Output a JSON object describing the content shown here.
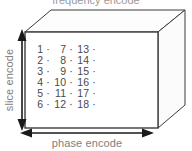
{
  "diagram": {
    "title_cutoff": "frequency encode",
    "axes": {
      "vertical_label": "slice encode",
      "horizontal_label": "phase encode",
      "vertical_arrow": "double-headed-vertical-arrow",
      "horizontal_arrow": "double-headed-horizontal-arrow"
    },
    "box": {
      "shape": "cuboid",
      "stroke": "#3c3c3c",
      "face_fill": "#ffffff",
      "top_face_fill": "#fdfdfd",
      "side_face_fill": "#fbfbfb"
    },
    "grid": {
      "rows": 6,
      "cols": 3,
      "separator": "·",
      "trailing_separator": "·",
      "text_color": "#4a4a4a",
      "cells": [
        [
          "1",
          "7",
          "13"
        ],
        [
          "2",
          "8",
          "14"
        ],
        [
          "3",
          "9",
          "15"
        ],
        [
          "4",
          "10",
          "16"
        ],
        [
          "5",
          "11",
          "17"
        ],
        [
          "6",
          "12",
          "18"
        ]
      ]
    }
  }
}
